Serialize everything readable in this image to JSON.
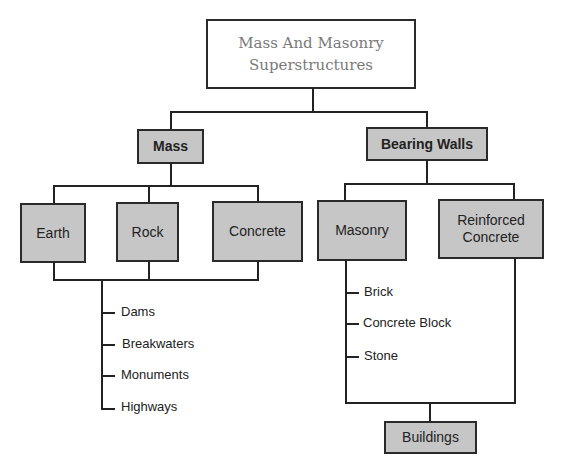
{
  "title": {
    "line1": "Mass And Masonry",
    "line2": "Superstructures"
  },
  "level1": {
    "mass": "Mass",
    "bearing_walls": "Bearing Walls"
  },
  "mass_children": [
    "Earth",
    "Rock",
    "Concrete"
  ],
  "bearing_children": {
    "masonry": "Masonry",
    "reinforced_line1": "Reinforced",
    "reinforced_line2": "Concrete"
  },
  "mass_uses": [
    "Dams",
    "Breakwaters",
    "Monuments",
    "Highways"
  ],
  "masonry_types": [
    "Brick",
    "Concrete Block",
    "Stone"
  ],
  "bearing_result": "Buildings",
  "colors": {
    "box_fill": "#c6c6c6",
    "line": "#222222",
    "title_text": "#7a7a7a"
  }
}
